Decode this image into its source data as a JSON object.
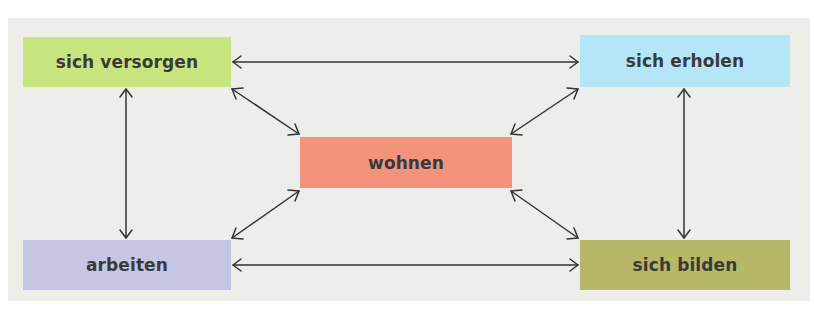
{
  "diagram": {
    "type": "relationship-diagram",
    "center": {
      "id": "wohnen",
      "label": "wohnen",
      "color": "#f4937c"
    },
    "nodes": [
      {
        "id": "versorgen",
        "label": "sich versorgen",
        "color": "#c9e57f",
        "position": "top-left"
      },
      {
        "id": "erholen",
        "label": "sich erholen",
        "color": "#b5e6f7",
        "position": "top-right"
      },
      {
        "id": "arbeiten",
        "label": "arbeiten",
        "color": "#c6c5e4",
        "position": "bottom-left"
      },
      {
        "id": "bilden",
        "label": "sich bilden",
        "color": "#b6b767",
        "position": "bottom-right"
      }
    ],
    "edges": [
      {
        "from": "sich versorgen",
        "to": "sich erholen",
        "type": "bidirectional"
      },
      {
        "from": "arbeiten",
        "to": "sich bilden",
        "type": "bidirectional"
      },
      {
        "from": "sich versorgen",
        "to": "arbeiten",
        "type": "bidirectional"
      },
      {
        "from": "sich erholen",
        "to": "sich bilden",
        "type": "bidirectional"
      },
      {
        "from": "sich versorgen",
        "to": "wohnen",
        "type": "bidirectional"
      },
      {
        "from": "sich erholen",
        "to": "wohnen",
        "type": "bidirectional"
      },
      {
        "from": "arbeiten",
        "to": "wohnen",
        "type": "bidirectional"
      },
      {
        "from": "sich bilden",
        "to": "wohnen",
        "type": "bidirectional"
      }
    ],
    "panel_color": "#ededea",
    "arrow_color": "#333333"
  }
}
